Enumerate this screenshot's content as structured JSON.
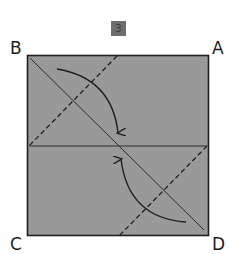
{
  "diagram": {
    "step_number": "3",
    "corners": {
      "top_left": "B",
      "top_right": "A",
      "bottom_left": "C",
      "bottom_right": "D"
    },
    "colors": {
      "paper_fill": "#999999",
      "line": "#1f1f1f",
      "badge_fill": "#6e6e6e",
      "background": "#ffffff"
    },
    "elements": [
      {
        "type": "square",
        "label": "paper",
        "from": [
          27,
          55
        ],
        "to": [
          209,
          236
        ]
      },
      {
        "type": "crease",
        "style": "solid",
        "label": "horizontal-midline",
        "from": [
          29,
          146
        ],
        "to": [
          207,
          146
        ]
      },
      {
        "type": "crease",
        "style": "solid",
        "label": "diagonal-B-D",
        "from": [
          30,
          58
        ],
        "to": [
          204,
          230
        ]
      },
      {
        "type": "fold-line",
        "style": "dashed",
        "label": "valley-fold-upper-left",
        "from": [
          117,
          56
        ],
        "to": [
          29,
          146
        ]
      },
      {
        "type": "fold-line",
        "style": "dashed",
        "label": "valley-fold-lower-right",
        "from": [
          207,
          146
        ],
        "to": [
          119,
          236
        ]
      },
      {
        "type": "arrow",
        "label": "fold-corner-B-to-center",
        "from": [
          57,
          69
        ],
        "to": [
          118,
          134
        ]
      },
      {
        "type": "arrow",
        "label": "fold-corner-D-to-center",
        "from": [
          186,
          222
        ],
        "to": [
          121,
          158
        ]
      }
    ]
  }
}
